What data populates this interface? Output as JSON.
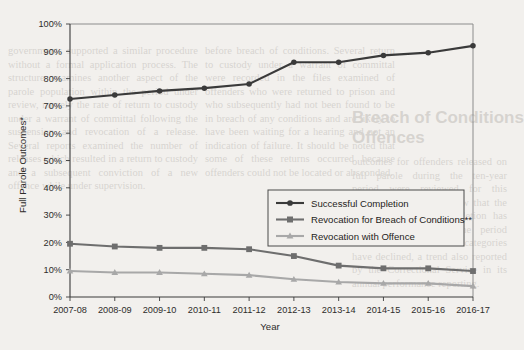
{
  "chart_data": {
    "type": "line",
    "title": "",
    "xlabel": "Year",
    "ylabel": "Full Parole Outcomes*",
    "categories": [
      "2007-08",
      "2008-09",
      "2009-10",
      "2010-11",
      "2011-12",
      "2012-13",
      "2013-14",
      "2014-15",
      "2015-16",
      "2016-17"
    ],
    "ylim": [
      0,
      100
    ],
    "ytick_labels": [
      "0%",
      "10%",
      "20%",
      "30%",
      "40%",
      "50%",
      "60%",
      "70%",
      "80%",
      "90%",
      "100%"
    ],
    "ytick_values": [
      0,
      10,
      20,
      30,
      40,
      50,
      60,
      70,
      80,
      90,
      100
    ],
    "grid": false,
    "legend_position": "center-right",
    "series": [
      {
        "name": "Successful Completion",
        "marker": "circle",
        "color": "#3a3a3a",
        "values": [
          72.5,
          74.0,
          75.5,
          76.5,
          78.0,
          86.0,
          86.0,
          88.5,
          89.5,
          92.0
        ]
      },
      {
        "name": "Revocation for Breach of Conditions**",
        "marker": "square",
        "color": "#6e6e6e",
        "values": [
          19.5,
          18.5,
          18.0,
          18.0,
          17.5,
          15.0,
          11.5,
          10.5,
          10.5,
          9.5
        ]
      },
      {
        "name": "Revocation with Offence",
        "marker": "triangle",
        "color": "#a8a8a8",
        "values": [
          9.5,
          9.0,
          9.0,
          8.5,
          8.0,
          6.5,
          5.5,
          5.0,
          5.0,
          4.0
        ]
      }
    ]
  },
  "page_background_text": {
    "heading_line1": "Breach of Conditions",
    "heading_line2": "Offences",
    "left_column": "governments supported a similar procedure without a formal application process. The structure examines another aspect of the parole population within the period under review, namely the rate of return to custody under a warrant of committal following the suspension and revocation of a release. Several reports examined the number of releases which resulted in a return to custody and a subsequent conviction of a new offence while under supervision.",
    "center_column": "before breach of conditions. Several return to custody under a warrant of committal were recorded in the files examined of offenders who were returned to prison and who subsequently had not been found to be in breach of any conditions and are likely to have been waiting for a hearing and not an indication of failure. It should be noted that some of these returns occurred because offenders could not be located or absconded.",
    "right_column": "outcomes for offenders released on full parole during the ten-year period were reviewed for this analysis. The results show that the rate of successful completion has risen steadily across the period while both revocation categories have declined, a trend also reported by the Correctional Service in its annual performance reporting."
  }
}
